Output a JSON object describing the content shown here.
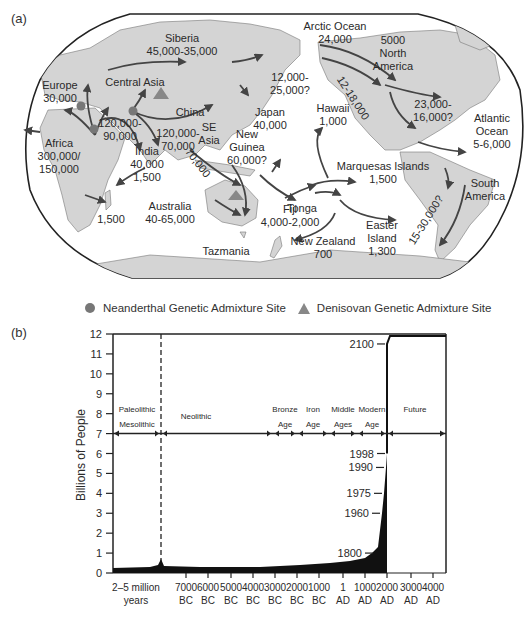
{
  "panel_a": {
    "label": "(a)",
    "map_labels": [
      {
        "name": "Siberia",
        "lines": [
          "Siberia",
          "45,000-35,000"
        ],
        "x": 182,
        "y": 42
      },
      {
        "name": "Europe",
        "lines": [
          "Europe",
          "30,000"
        ],
        "x": 60,
        "y": 89
      },
      {
        "name": "Central Asia",
        "lines": [
          "Central Asia"
        ],
        "x": 135,
        "y": 86
      },
      {
        "name": "China",
        "lines": [
          "China"
        ],
        "x": 190,
        "y": 116
      },
      {
        "name": "Africa-out",
        "lines": [
          "120,000-",
          "90,000"
        ],
        "x": 120,
        "y": 127
      },
      {
        "name": "SE Asia route",
        "lines": [
          "120,000-",
          "70,000"
        ],
        "x": 178,
        "y": 137
      },
      {
        "name": "SE Asia",
        "lines": [
          "SE",
          "Asia"
        ],
        "x": 209,
        "y": 131
      },
      {
        "name": "Africa",
        "lines": [
          "Africa",
          "300,000/",
          "150,000"
        ],
        "x": 59,
        "y": 147
      },
      {
        "name": "India",
        "lines": [
          "India",
          "40,000",
          "1,500"
        ],
        "x": 147,
        "y": 155
      },
      {
        "name": "Japan",
        "lines": [
          "Japan",
          "40,000"
        ],
        "x": 270,
        "y": 116
      },
      {
        "name": "New Guinea",
        "lines": [
          "New",
          "Guinea",
          "60,000?"
        ],
        "x": 247,
        "y": 138
      },
      {
        "name": "Hawaii",
        "lines": [
          "Hawaii",
          "1,000"
        ],
        "x": 333,
        "y": 112
      },
      {
        "name": "Arctic Ocean",
        "lines": [
          "Arctic Ocean",
          "24,000"
        ],
        "x": 335,
        "y": 30
      },
      {
        "name": "Bering",
        "lines": [
          "12,000-",
          "25,000?"
        ],
        "x": 290,
        "y": 81
      },
      {
        "name": "North America",
        "lines": [
          "5000",
          "North",
          "America"
        ],
        "x": 393,
        "y": 44
      },
      {
        "name": "NA east",
        "lines": [
          "23,000-",
          "16,000?"
        ],
        "x": 433,
        "y": 108
      },
      {
        "name": "Atlantic Ocean",
        "lines": [
          "Atlantic",
          "Ocean",
          "5-6,000"
        ],
        "x": 492,
        "y": 122
      },
      {
        "name": "Marquesas",
        "lines": [
          "Marquesas Islands",
          "1,500"
        ],
        "x": 383,
        "y": 170
      },
      {
        "name": "South America",
        "lines": [
          "South",
          "America"
        ],
        "x": 485,
        "y": 187
      },
      {
        "name": "Australia",
        "lines": [
          "Australia",
          "40-65,000"
        ],
        "x": 170,
        "y": 210
      },
      {
        "name": "Madagascar",
        "lines": [
          "1,500"
        ],
        "x": 111,
        "y": 223
      },
      {
        "name": "Fiji",
        "lines": [
          "Fiji",
          "4,000-2,000"
        ],
        "x": 290,
        "y": 213
      },
      {
        "name": "Tonga",
        "lines": [
          "Tonga"
        ],
        "x": 302,
        "y": 212
      },
      {
        "name": "Easter Island",
        "lines": [
          "Easter",
          "Island",
          "1,300"
        ],
        "x": 382,
        "y": 229
      },
      {
        "name": "New Zealand",
        "lines": [
          "New Zealand",
          "700"
        ],
        "x": 323,
        "y": 245
      },
      {
        "name": "Tazmania",
        "lines": [
          "Tazmania"
        ],
        "x": 226,
        "y": 255
      }
    ],
    "rotated_labels": [
      {
        "text": "12-18,000",
        "x": 350,
        "y": 100,
        "angle": 57
      },
      {
        "text": "70,000",
        "x": 195,
        "y": 165,
        "angle": 52
      },
      {
        "text": "15-30,000?",
        "x": 429,
        "y": 222,
        "angle": -58
      }
    ],
    "legend": {
      "neanderthal": "Neanderthal Genetic Admixture Site",
      "denisovan": "Denisovan Genetic Admixture Site"
    }
  },
  "panel_b": {
    "label": "(b)"
  },
  "chart_data": {
    "type": "area",
    "title": "",
    "xlabel": "",
    "ylabel": "Billions of People",
    "ylim": [
      0,
      12
    ],
    "yticks": [
      0,
      1,
      2,
      3,
      4,
      5,
      6,
      7,
      8,
      9,
      10,
      11,
      12
    ],
    "grid": false,
    "x_tick_labels": [
      {
        "l1": "2–5 million",
        "l2": "years"
      },
      {
        "l1": "7000",
        "l2": "BC"
      },
      {
        "l1": "6000",
        "l2": "BC"
      },
      {
        "l1": "5000",
        "l2": "BC"
      },
      {
        "l1": "4000",
        "l2": "BC"
      },
      {
        "l1": "3000",
        "l2": "BC"
      },
      {
        "l1": "2000",
        "l2": "BC"
      },
      {
        "l1": "1000",
        "l2": "BC"
      },
      {
        "l1": "1",
        "l2": "AD"
      },
      {
        "l1": "1000",
        "l2": "AD"
      },
      {
        "l1": "2000",
        "l2": "AD"
      },
      {
        "l1": "3000",
        "l2": "AD"
      },
      {
        "l1": "4000",
        "l2": "AD"
      }
    ],
    "series": [
      {
        "name": "World population (billions)",
        "x": [
          "7000 BC",
          "5000 BC",
          "3000 BC",
          "1000 BC",
          "1 AD",
          "1000 AD",
          "1800 AD",
          "1960 AD",
          "1975 AD",
          "1990 AD",
          "1998 AD",
          "2100 AD"
        ],
        "values": [
          0.01,
          0.03,
          0.05,
          0.1,
          0.2,
          0.3,
          1.0,
          3.0,
          4.0,
          5.3,
          6.0,
          11.5
        ]
      }
    ],
    "annotations": [
      {
        "label": "1800",
        "value": 1.0
      },
      {
        "label": "1960",
        "value": 3.0
      },
      {
        "label": "1975",
        "value": 4.0
      },
      {
        "label": "1990",
        "value": 5.3
      },
      {
        "label": "1998",
        "value": 6.0
      },
      {
        "label": "2100",
        "value": 11.5
      }
    ],
    "eras": [
      {
        "l1": "Paleolithic",
        "l2": "Mesolithic"
      },
      {
        "l1": "Neolithic",
        "l2": ""
      },
      {
        "l1": "Bronze",
        "l2": "Age"
      },
      {
        "l1": "Iron",
        "l2": "Age"
      },
      {
        "l1": "Middle",
        "l2": "Ages"
      },
      {
        "l1": "Modern",
        "l2": "Age"
      },
      {
        "l1": "Future",
        "l2": ""
      }
    ]
  }
}
